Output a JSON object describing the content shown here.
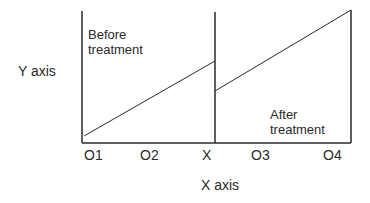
{
  "diagram": {
    "y_axis_label": "Y axis",
    "x_axis_label": "X axis",
    "before_label_line1": "Before",
    "before_label_line2": "treatment",
    "after_label_line1": "After",
    "after_label_line2": "treatment",
    "ticks": [
      "O1",
      "O2",
      "X",
      "O3",
      "O4"
    ],
    "line_color": "#2a2a2a"
  }
}
